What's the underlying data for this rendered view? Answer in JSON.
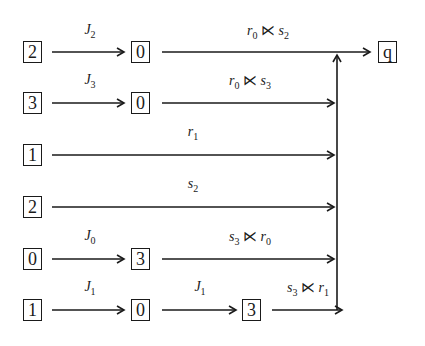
{
  "diagram": {
    "type": "state-transition-chain",
    "target_state": "q",
    "rows": [
      {
        "start": "2",
        "mid": "0",
        "mid2": null,
        "label1": "J",
        "label1_sub": "2",
        "label2": "r",
        "label2_sub": "0",
        "label2_op": "⋉",
        "label2_b": "s",
        "label2_b_sub": "2"
      },
      {
        "start": "3",
        "mid": "0",
        "mid2": null,
        "label1": "J",
        "label1_sub": "3",
        "label2": "r",
        "label2_sub": "0",
        "label2_op": "⋉",
        "label2_b": "s",
        "label2_b_sub": "3"
      },
      {
        "start": "1",
        "mid": null,
        "mid2": null,
        "label1": null,
        "label2": "r",
        "label2_sub": "1"
      },
      {
        "start": "2",
        "mid": null,
        "mid2": null,
        "label1": null,
        "label2": "s",
        "label2_sub": "2"
      },
      {
        "start": "0",
        "mid": "3",
        "mid2": null,
        "label1": "J",
        "label1_sub": "0",
        "label2": "s",
        "label2_sub": "3",
        "label2_op": "⋉",
        "label2_b": "r",
        "label2_b_sub": "0"
      },
      {
        "start": "1",
        "mid": "0",
        "mid2": "3",
        "label1": "J",
        "label1_sub": "1",
        "label_mid": "J",
        "label_mid_sub": "1",
        "label2": "s",
        "label2_sub": "3",
        "label2_op": "⋉",
        "label2_b": "r",
        "label2_b_sub": "1"
      }
    ]
  }
}
